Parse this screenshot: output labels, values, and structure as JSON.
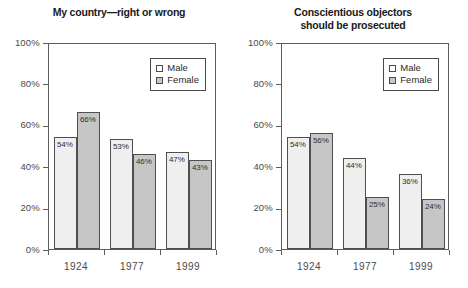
{
  "chart_data": [
    {
      "type": "bar",
      "title": "My country—right or wrong",
      "title_line1": "My country—right or wrong",
      "title_line2": "",
      "categories": [
        "1924",
        "1977",
        "1999"
      ],
      "series": [
        {
          "name": "Male",
          "values": [
            54,
            53,
            47
          ],
          "labels": [
            "54%",
            "53%",
            "47%"
          ],
          "color": "#efefef"
        },
        {
          "name": "Female",
          "values": [
            66,
            46,
            43
          ],
          "labels": [
            "66%",
            "46%",
            "43%"
          ],
          "color": "#c6c6c6"
        }
      ],
      "xlabel": "",
      "ylabel": "",
      "ylim": [
        0,
        100
      ],
      "yticks": [
        0,
        20,
        40,
        60,
        80,
        100
      ],
      "ytick_labels": [
        "0%",
        "20%",
        "40%",
        "60%",
        "80%",
        "100%"
      ],
      "grid": false,
      "legend_position": "upper right"
    },
    {
      "type": "bar",
      "title": "Conscientious objectors should be prosecuted",
      "title_line1": "Conscientious objectors",
      "title_line2": "should be prosecuted",
      "categories": [
        "1924",
        "1977",
        "1999"
      ],
      "series": [
        {
          "name": "Male",
          "values": [
            54,
            44,
            36
          ],
          "labels": [
            "54%",
            "44%",
            "36%"
          ],
          "color": "#efefef"
        },
        {
          "name": "Female",
          "values": [
            56,
            25,
            24
          ],
          "labels": [
            "56%",
            "25%",
            "24%"
          ],
          "color": "#c6c6c6"
        }
      ],
      "xlabel": "",
      "ylabel": "",
      "ylim": [
        0,
        100
      ],
      "yticks": [
        0,
        20,
        40,
        60,
        80,
        100
      ],
      "ytick_labels": [
        "0%",
        "20%",
        "40%",
        "60%",
        "80%",
        "100%"
      ],
      "grid": false,
      "legend_position": "upper right"
    }
  ],
  "colors": {
    "male_fill": "#efefef",
    "female_fill": "#c6c6c6",
    "bar_border": "#4f4f4f",
    "axis": "#5d5d5d",
    "text": "#3a3a3a",
    "background": "#ffffff"
  }
}
